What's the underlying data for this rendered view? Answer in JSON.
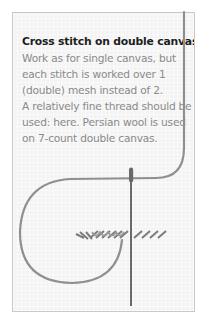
{
  "panel": {
    "title": "Cross stitch on double canvas:",
    "body_lines": [
      "Work as for single canvas, but",
      "each stitch is worked over 1",
      "(double) mesh instead of 2.",
      "A relatively fine thread should be",
      "used: here. Persian wool is used",
      "on 7-count double canvas."
    ]
  },
  "illustration": {
    "description": "needle with thread working cross stitches on double canvas",
    "thread_color": "#8f8f8f",
    "needle_color": "#6a6a6a",
    "canvas_color": "#f3f3f3"
  }
}
